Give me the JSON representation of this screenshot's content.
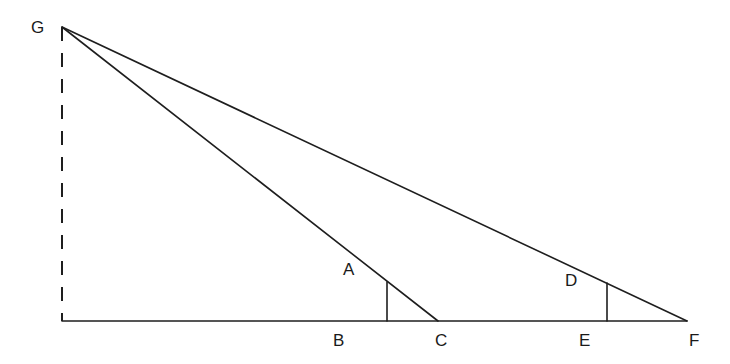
{
  "diagram": {
    "title": "",
    "type": "similar-triangles-geometry",
    "colors": {
      "line": "#1e1e1e",
      "label": "#1a1a1a",
      "background": "#ffffff"
    },
    "points": {
      "G": {
        "label": "G",
        "x": 62,
        "y": 27,
        "label_x": 31,
        "label_y": 33
      },
      "H": {
        "label": "",
        "x": 62,
        "y": 321
      },
      "A": {
        "label": "A",
        "x": 387,
        "y": 282,
        "label_x": 343,
        "label_y": 275
      },
      "B": {
        "label": "B",
        "x": 387,
        "y": 321,
        "label_x": 333,
        "label_y": 346
      },
      "C": {
        "label": "C",
        "x": 438,
        "y": 321,
        "label_x": 435,
        "label_y": 346
      },
      "D": {
        "label": "D",
        "x": 607,
        "y": 283,
        "label_x": 565,
        "label_y": 286
      },
      "E": {
        "label": "E",
        "x": 607,
        "y": 321,
        "label_x": 579,
        "label_y": 346
      },
      "F": {
        "label": "F",
        "x": 687,
        "y": 321,
        "label_x": 689,
        "label_y": 346
      }
    },
    "segments": [
      {
        "name": "dashed-height-GH",
        "from": "G",
        "to": "H",
        "style": "dashed"
      },
      {
        "name": "base-HF",
        "from": "H",
        "to": "F",
        "style": "solid"
      },
      {
        "name": "hypotenuse-GC",
        "from": "G",
        "to": "C",
        "style": "solid"
      },
      {
        "name": "hypotenuse-GF",
        "from": "G",
        "to": "F",
        "style": "solid"
      },
      {
        "name": "vertical-AB",
        "from": "A",
        "to": "B",
        "style": "solid"
      },
      {
        "name": "vertical-DE",
        "from": "D",
        "to": "E",
        "style": "solid"
      }
    ]
  }
}
